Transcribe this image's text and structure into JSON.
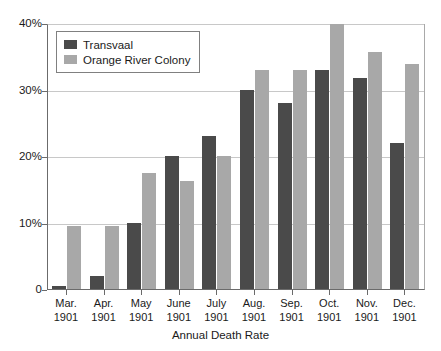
{
  "chart_data": {
    "type": "bar",
    "title": "",
    "xlabel": "Annual Death Rate",
    "ylabel": "",
    "categories": [
      "Mar. 1901",
      "Apr. 1901",
      "May 1901",
      "June 1901",
      "July 1901",
      "Aug. 1901",
      "Sep. 1901",
      "Oct. 1901",
      "Nov. 1901",
      "Dec. 1901"
    ],
    "category_lines": [
      [
        "Mar.",
        "1901"
      ],
      [
        "Apr.",
        "1901"
      ],
      [
        "May",
        "1901"
      ],
      [
        "June",
        "1901"
      ],
      [
        "July",
        "1901"
      ],
      [
        "Aug.",
        "1901"
      ],
      [
        "Sep.",
        "1901"
      ],
      [
        "Oct.",
        "1901"
      ],
      [
        "Nov.",
        "1901"
      ],
      [
        "Dec.",
        "1901"
      ]
    ],
    "series": [
      {
        "name": "Transvaal",
        "color": "#4a4a4a",
        "values": [
          0.5,
          2.0,
          10.0,
          20.0,
          23.0,
          30.0,
          27.9,
          32.9,
          31.8,
          22.0
        ]
      },
      {
        "name": "Orange River Colony",
        "color": "#a8a8a8",
        "values": [
          9.5,
          9.5,
          17.5,
          16.3,
          20.0,
          32.9,
          32.9,
          39.8,
          35.7,
          33.8
        ]
      }
    ],
    "ylim": [
      0,
      40
    ],
    "yticks": [
      0,
      10,
      20,
      30,
      40
    ],
    "ytick_labels": [
      "0",
      "10%",
      "20%",
      "30%",
      "40%"
    ],
    "grid": true,
    "legend_position": "top-left"
  }
}
